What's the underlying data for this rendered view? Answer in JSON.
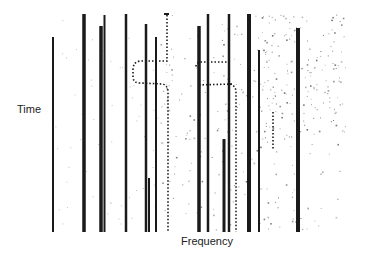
{
  "title": "",
  "axes": {
    "xlabel": "Frequency",
    "ylabel": "Time"
  },
  "colors": {
    "line": "#1a1a1a",
    "noise": "#555555",
    "background": "#ffffff"
  },
  "plot_area": {
    "left": 48,
    "right": 345,
    "top": 12,
    "bottom": 232
  },
  "solid_lines": [
    {
      "x": 53,
      "top": 37,
      "width": 2
    },
    {
      "x": 84,
      "top": 14,
      "width": 3.5
    },
    {
      "x": 101,
      "top": 26,
      "width": 3.5
    },
    {
      "x": 104.5,
      "top": 15,
      "width": 2
    },
    {
      "x": 126,
      "top": 14,
      "width": 2.5
    },
    {
      "x": 146,
      "top": 24,
      "width": 2.5
    },
    {
      "x": 156,
      "top": 37,
      "width": 2
    },
    {
      "x": 149,
      "top": 178,
      "width": 2
    },
    {
      "x": 199,
      "top": 26,
      "width": 3.5
    },
    {
      "x": 208,
      "top": 14,
      "width": 2.5
    },
    {
      "x": 229,
      "top": 14,
      "width": 2.5
    },
    {
      "x": 224,
      "top": 139,
      "width": 3
    },
    {
      "x": 249,
      "top": 14,
      "width": 4
    },
    {
      "x": 259,
      "top": 50,
      "width": 2
    },
    {
      "x": 298,
      "top": 28,
      "width": 4
    }
  ],
  "dotted_paths": [
    "M167,15 L167,61 L140,61 Q133,62 133,70 L133,78 Q134,83 140,83 L163,84 Q168,86 168,92 L168,232",
    "M230,62 L200,62 Q196,63 196,67",
    "M232,84 L198,85",
    "M230,84 Q236,86 236,92 L236,232",
    "M273,112 L273,150"
  ],
  "noise_regions": [
    {
      "x": 160,
      "y": 14,
      "w": 185,
      "h": 218,
      "density": 0.5
    },
    {
      "x": 260,
      "y": 14,
      "w": 85,
      "h": 130,
      "density": 1
    }
  ]
}
